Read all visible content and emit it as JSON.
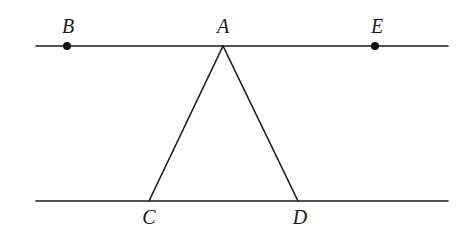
{
  "diagram": {
    "type": "geometry",
    "colors": {
      "stroke": "#1a1a1a",
      "point": "#111111",
      "background": "#ffffff"
    },
    "lines": [
      {
        "id": "top-line",
        "x1": 36,
        "y1": 46,
        "x2": 448,
        "y2": 46
      },
      {
        "id": "bottom-line",
        "x1": 36,
        "y1": 201,
        "x2": 448,
        "y2": 201
      },
      {
        "id": "segment-AC",
        "x1": 223,
        "y1": 46,
        "x2": 149,
        "y2": 201
      },
      {
        "id": "segment-AD",
        "x1": 223,
        "y1": 46,
        "x2": 298,
        "y2": 201
      }
    ],
    "points": [
      {
        "id": "B",
        "x": 67,
        "y": 46,
        "dot": true
      },
      {
        "id": "A",
        "x": 223,
        "y": 46,
        "dot": false
      },
      {
        "id": "E",
        "x": 375,
        "y": 46,
        "dot": true
      },
      {
        "id": "C",
        "x": 149,
        "y": 201,
        "dot": false
      },
      {
        "id": "D",
        "x": 298,
        "y": 201,
        "dot": false
      }
    ],
    "labels": {
      "B": {
        "text": "B",
        "x": 68,
        "y": 33
      },
      "A": {
        "text": "A",
        "x": 223,
        "y": 33
      },
      "E": {
        "text": "E",
        "x": 377,
        "y": 33
      },
      "C": {
        "text": "C",
        "x": 149,
        "y": 224
      },
      "D": {
        "text": "D",
        "x": 300,
        "y": 224
      }
    }
  }
}
